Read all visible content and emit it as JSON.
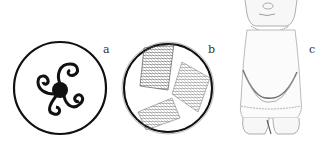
{
  "figure": {
    "panels": [
      {
        "label": "a",
        "description": "Circle enclosing a triskele of three spirals around a black center"
      },
      {
        "label": "b",
        "description": "Circle enclosing three hatched rectangular textile fragments"
      },
      {
        "label": "c",
        "description": "Stippled standing figurine"
      }
    ]
  }
}
